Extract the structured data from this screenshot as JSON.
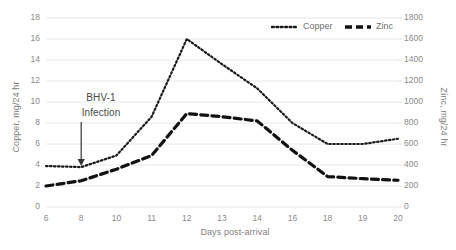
{
  "chart_data": {
    "type": "line",
    "title": "",
    "xlabel": "Days post-arrival",
    "categories": [
      "6",
      "8",
      "10",
      "11",
      "12",
      "13",
      "14",
      "16",
      "18",
      "19",
      "20"
    ],
    "grid": true,
    "legend_position": "top-right",
    "axes": {
      "left": {
        "label": "Copper, mg/24 hr",
        "ylim": [
          0,
          18
        ],
        "ticks": [
          "0",
          "2",
          "4",
          "6",
          "8",
          "10",
          "12",
          "14",
          "16",
          "18"
        ]
      },
      "right": {
        "label": "Zinc, mg/24 hr",
        "ylim": [
          0,
          1800
        ],
        "ticks": [
          "0",
          "200",
          "400",
          "600",
          "800",
          "1000",
          "1200",
          "1400",
          "1600",
          "1800"
        ]
      }
    },
    "series": [
      {
        "name": "Copper",
        "axis": "left",
        "style": "dotted",
        "color": "#1a1a1a",
        "values": [
          3.9,
          3.8,
          4.9,
          8.6,
          16.0,
          13.6,
          11.3,
          8.0,
          6.0,
          6.0,
          6.5
        ]
      },
      {
        "name": "Zinc",
        "axis": "right",
        "style": "dashed",
        "color": "#111111",
        "values": [
          200,
          250,
          360,
          490,
          890,
          860,
          820,
          540,
          290,
          270,
          255
        ]
      }
    ],
    "annotations": [
      {
        "name": "bhv1-infection",
        "line1": "BHV-1",
        "line2": "Infection",
        "arrow_at_category": "8",
        "arrow_direction": "down"
      }
    ]
  },
  "legend": {
    "items": [
      {
        "label": "Copper",
        "style": "dotted"
      },
      {
        "label": "Zinc",
        "style": "dashed"
      }
    ]
  }
}
